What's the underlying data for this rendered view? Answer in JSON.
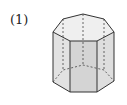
{
  "problem": {
    "number_label": "(1)"
  },
  "figure": {
    "type": "hexagonal-prism",
    "stroke_color": "#333333",
    "face_fill": "#e6e6e6",
    "front_face_fill": "#d6d6d6",
    "top_fill": "#efefef"
  }
}
